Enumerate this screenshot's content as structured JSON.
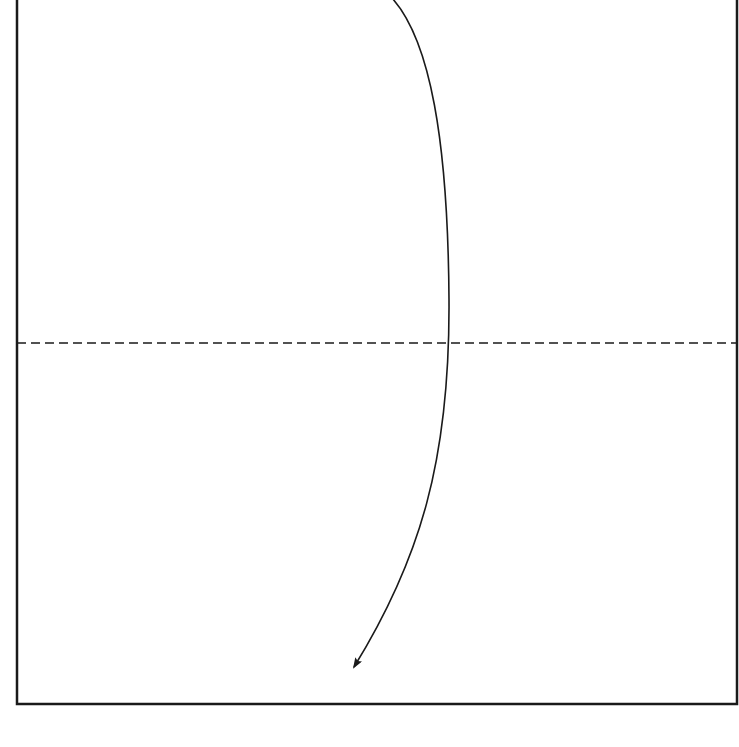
{
  "diagram": {
    "type": "folding-instruction",
    "colors": {
      "background": "#ffffff",
      "stroke": "#1a1a1a"
    },
    "paper": {
      "left": 17,
      "top": -2,
      "right": 737,
      "bottom": 704
    },
    "fold_line": {
      "style": "dashed",
      "y": 343,
      "x_start": 17,
      "x_end": 737
    },
    "arrow": {
      "direction": "down-fold",
      "path": "M 392 -2 C 430 40, 448 140, 449 300 C 450 460, 420 560, 354 667",
      "tip": [
        352,
        669
      ]
    }
  }
}
